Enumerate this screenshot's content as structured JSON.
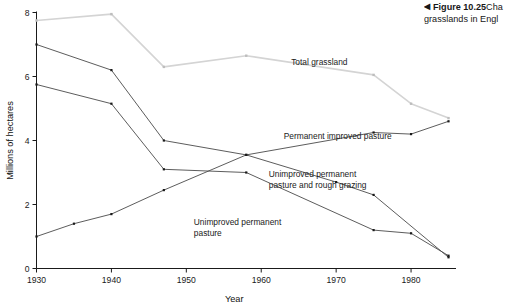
{
  "caption": {
    "arrow_icon": "left-triangle-icon",
    "number": "Figure 10.25",
    "line1_text": "Cha",
    "line2_text": "grasslands in Engl"
  },
  "chart_data": {
    "type": "line",
    "title": "",
    "xlabel": "Year",
    "ylabel": "Millions of hectares",
    "xlim": [
      1930,
      1986
    ],
    "ylim": [
      0,
      8
    ],
    "xticks": [
      1930,
      1940,
      1950,
      1960,
      1970,
      1980
    ],
    "xticklabels": [
      "1930",
      "1940",
      "1950",
      "1960",
      "1970",
      "1980"
    ],
    "yticks": [
      0,
      2,
      4,
      6,
      8
    ],
    "yticklabels": [
      "0",
      "2",
      "4",
      "6",
      "8"
    ],
    "grid": false,
    "legend": "inline-annotations",
    "marker": "square",
    "series": [
      {
        "name": "Total grassland",
        "color": "#d4d4d4",
        "label_x": 1964,
        "label_y": 6.35,
        "x": [
          1930,
          1940,
          1947,
          1958,
          1975,
          1980,
          1985
        ],
        "y": [
          7.75,
          7.95,
          6.3,
          6.65,
          6.05,
          5.15,
          4.7
        ]
      },
      {
        "name": "Unimproved permanent pasture and rough grazing",
        "color": "#4a4a4a",
        "label_x": 1961,
        "label_y": 2.85,
        "x": [
          1930,
          1940,
          1947,
          1958,
          1970,
          1975,
          1985
        ],
        "y": [
          7.0,
          6.2,
          4.0,
          3.55,
          2.7,
          2.3,
          0.35
        ]
      },
      {
        "name": "Unimproved permanent pasture",
        "color": "#4a4a4a",
        "label_x": 1951,
        "label_y": 1.35,
        "x": [
          1930,
          1940,
          1947,
          1958,
          1975,
          1980,
          1985
        ],
        "y": [
          5.75,
          5.15,
          3.1,
          3.0,
          1.2,
          1.1,
          0.4
        ]
      },
      {
        "name": "Permanent improved pasture",
        "color": "#4a4a4a",
        "label_x": 1963,
        "label_y": 4.05,
        "x": [
          1930,
          1935,
          1940,
          1947,
          1958,
          1975,
          1980,
          1985
        ],
        "y": [
          1.0,
          1.4,
          1.7,
          2.45,
          3.55,
          4.25,
          4.2,
          4.6
        ]
      }
    ],
    "series_label_lines": {
      "Total grassland": [
        "Total grassland"
      ],
      "Unimproved permanent pasture and rough grazing": [
        "Unimproved permanent",
        "pasture and rough grazing"
      ],
      "Unimproved permanent pasture": [
        "Unimproved permanent",
        "pasture"
      ],
      "Permanent improved pasture": [
        "Permanent improved pasture"
      ]
    }
  }
}
